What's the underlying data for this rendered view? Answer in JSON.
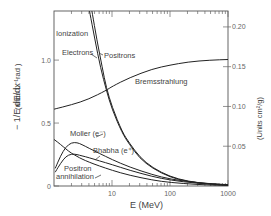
{
  "chart_data": {
    "type": "line",
    "title": "",
    "xlabel": "E    (MeV)",
    "ylabel_left": "-(1/E) dE/dx  (units L_rad^-1)",
    "ylabel_right": "(Units cm²/g)",
    "xscale": "log",
    "xlim": [
      1,
      1000
    ],
    "ylim_left": [
      0,
      1.39
    ],
    "ylim_right": [
      0,
      0.22
    ],
    "x_ticks": [
      {
        "value": 10,
        "label": "10"
      },
      {
        "value": 100,
        "label": "100"
      },
      {
        "value": 1000,
        "label": "1000"
      }
    ],
    "y_ticks_left": [
      {
        "value": 0,
        "label": "0"
      },
      {
        "value": 0.5,
        "label": "0.5"
      },
      {
        "value": 1.0,
        "label": "1.0"
      }
    ],
    "y_ticks_right": [
      {
        "value": 0.05,
        "label": "0.05"
      },
      {
        "value": 0.1,
        "label": "0.10"
      },
      {
        "value": 0.15,
        "label": "0.15"
      },
      {
        "value": 0.2,
        "label": "0.20"
      }
    ],
    "grid": false,
    "legend": "inline labels",
    "series": [
      {
        "name": "Electrons (Ionization)",
        "x": [
          4.1,
          5,
          6.4,
          8,
          10,
          15,
          20,
          30,
          50,
          100,
          200,
          500,
          1000
        ],
        "values": [
          1.39,
          1.18,
          0.93,
          0.76,
          0.61,
          0.42,
          0.33,
          0.22,
          0.14,
          0.07,
          0.035,
          0.015,
          0.008
        ]
      },
      {
        "name": "Positrons (Ionization)",
        "x": [
          4.5,
          5.5,
          6.8,
          8,
          10,
          15,
          20,
          30,
          50,
          100,
          200,
          500,
          1000
        ],
        "values": [
          1.39,
          1.16,
          0.94,
          0.78,
          0.63,
          0.43,
          0.34,
          0.23,
          0.145,
          0.075,
          0.037,
          0.016,
          0.009
        ]
      },
      {
        "name": "Bremsstrahlung",
        "x": [
          1,
          2,
          4,
          8,
          10,
          20,
          50,
          100,
          200,
          500,
          1000
        ],
        "values": [
          0.61,
          0.645,
          0.69,
          0.76,
          0.79,
          0.86,
          0.93,
          0.96,
          0.985,
          1.0,
          1.005
        ]
      },
      {
        "name": "Moller (e-)",
        "x": [
          1.05,
          1.3,
          1.6,
          2,
          2.5,
          3,
          4,
          6,
          10,
          20,
          50,
          100,
          300,
          1000
        ],
        "values": [
          0.14,
          0.24,
          0.31,
          0.345,
          0.345,
          0.33,
          0.3,
          0.26,
          0.21,
          0.15,
          0.09,
          0.055,
          0.025,
          0.01
        ]
      },
      {
        "name": "Bhabha (e+)",
        "x": [
          1.05,
          1.3,
          1.6,
          2,
          2.5,
          3,
          4,
          6,
          10,
          20,
          50,
          100,
          300,
          1000
        ],
        "values": [
          0.11,
          0.18,
          0.235,
          0.255,
          0.25,
          0.24,
          0.225,
          0.2,
          0.17,
          0.125,
          0.075,
          0.047,
          0.02,
          0.008
        ]
      },
      {
        "name": "Positron annihilation",
        "x": [
          1,
          1.3,
          1.6,
          2,
          2.5,
          3,
          4,
          6,
          10,
          20,
          50,
          100,
          300,
          1000
        ],
        "values": [
          0.37,
          0.33,
          0.295,
          0.26,
          0.235,
          0.215,
          0.19,
          0.16,
          0.125,
          0.085,
          0.047,
          0.028,
          0.011,
          0.004
        ]
      }
    ],
    "annotations": [
      {
        "text": "Ionization",
        "x_px": 56,
        "y_px": 36
      },
      {
        "text": "Electrons",
        "x_px": 62,
        "y_px": 55
      },
      {
        "text": "Positrons",
        "x_px": 104,
        "y_px": 58
      },
      {
        "text": "Bremsstrahlung",
        "x_px": 135,
        "y_px": 84
      },
      {
        "text": "Moller (e⁻)",
        "x_px": 70,
        "y_px": 136
      },
      {
        "text": "Bhabha (e⁺)",
        "x_px": 93,
        "y_px": 153
      },
      {
        "text": "Positron",
        "x_px": 64,
        "y_px": 171
      },
      {
        "text": "annihilation",
        "x_px": 56,
        "y_px": 179
      }
    ]
  },
  "labels": {
    "x_axis": "E    (MeV)",
    "y_left_main": "− 1/E  dE/dx",
    "y_left_units": "(units L⁻¹rad )",
    "y_right": "(Units cm²/g)"
  }
}
